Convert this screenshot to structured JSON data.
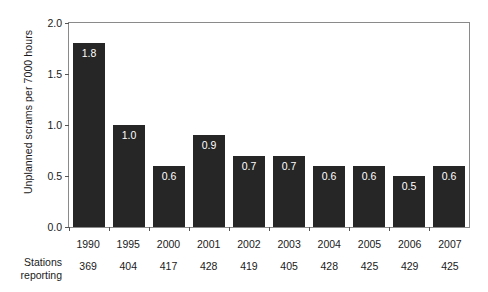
{
  "chart_data": {
    "type": "bar",
    "title": "",
    "xlabel": "",
    "ylabel": "Unplanned scrams per 7000 hours",
    "ylim": [
      0.0,
      2.0
    ],
    "yticks": [
      "0.0",
      "0.5",
      "1.0",
      "1.5",
      "2.0"
    ],
    "ytick_values": [
      0.0,
      0.5,
      1.0,
      1.5,
      2.0
    ],
    "grid": false,
    "legend": null,
    "bar_color": "#262626",
    "value_label_color": "#ffffff",
    "categories": [
      "1990",
      "1995",
      "2000",
      "2001",
      "2002",
      "2003",
      "2004",
      "2005",
      "2006",
      "2007"
    ],
    "values": [
      1.8,
      1.0,
      0.6,
      0.9,
      0.7,
      0.7,
      0.6,
      0.6,
      0.5,
      0.6
    ],
    "value_labels": [
      "1.8",
      "1.0",
      "0.6",
      "0.9",
      "0.7",
      "0.7",
      "0.6",
      "0.6",
      "0.5",
      "0.6"
    ],
    "secondary_row": {
      "header_line1": "Stations",
      "header_line2": "reporting",
      "values": [
        "369",
        "404",
        "417",
        "428",
        "419",
        "405",
        "428",
        "425",
        "429",
        "425"
      ]
    }
  }
}
